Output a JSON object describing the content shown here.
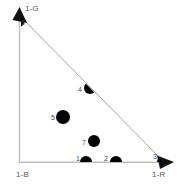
{
  "figure": {
    "type": "triangle-scatter",
    "width": 177,
    "height": 185,
    "background": "#ffffff",
    "axis_color": "#b8b8b8",
    "hypotenuse_color": "#9a9a9a",
    "point_color": "#000000",
    "label_color": "#5a5a5a"
  },
  "axes": {
    "vertical": {
      "label": "1-G",
      "arrow": "up-arrow-icon",
      "x": 19,
      "y_top": 18,
      "y_bottom": 162
    },
    "horizontal": {
      "label": "1-R",
      "arrow": "right-arrow-icon",
      "y": 162,
      "x_left": 19,
      "x_right": 163
    },
    "origin": {
      "label": "1-B",
      "x": 19,
      "y": 162
    }
  },
  "hypotenuse": {
    "x1": 21,
    "y1": 17,
    "x2": 162,
    "y2": 160
  },
  "chart_data": {
    "type": "scatter",
    "title": "",
    "xlabel": "1-R",
    "ylabel": "1-G",
    "origin_label": "1-B",
    "grid": false,
    "legend": null,
    "xlim": [
      0,
      1
    ],
    "ylim": [
      0,
      1
    ],
    "points": [
      {
        "id": "1",
        "label": "1",
        "x": 86,
        "y": 162,
        "r": 6,
        "clip": "bottom",
        "label_x": 76,
        "label_y": 155
      },
      {
        "id": "2",
        "label": "2",
        "x": 116,
        "y": 162,
        "r": 6,
        "clip": "bottom",
        "label_x": 104,
        "label_y": 155
      },
      {
        "id": "3",
        "label": "3",
        "x": 162,
        "y": 162,
        "r": 5,
        "clip": "corner-right",
        "label_x": 153,
        "label_y": 153
      },
      {
        "id": "4",
        "label": "4",
        "x": 90,
        "y": 88,
        "r": 6,
        "clip": "hypotenuse",
        "label_x": 78,
        "label_y": 86
      },
      {
        "id": "5",
        "label": "5",
        "x": 63,
        "y": 117,
        "r": 7,
        "clip": "none",
        "label_x": 51,
        "label_y": 114
      },
      {
        "id": "6",
        "label": "6",
        "x": 19,
        "y": 22,
        "r": 5,
        "clip": "corner-top",
        "label_x": 21,
        "label_y": 19
      },
      {
        "id": "7",
        "label": "7",
        "x": 94,
        "y": 141,
        "r": 6,
        "clip": "none",
        "label_x": 82,
        "label_y": 139
      }
    ]
  }
}
